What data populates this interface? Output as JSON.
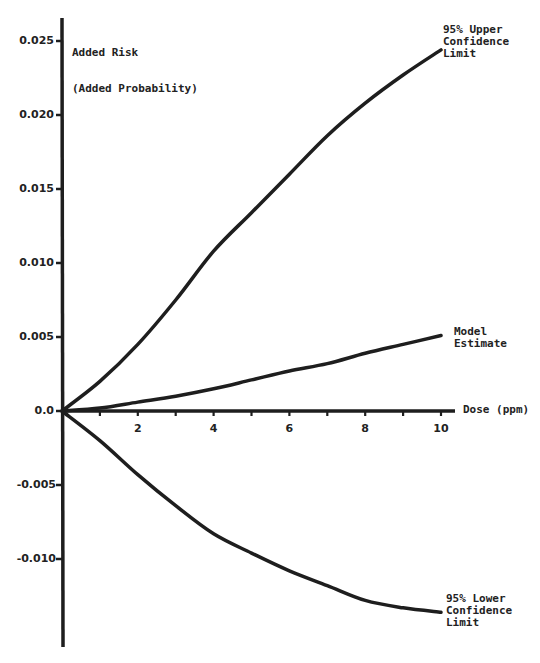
{
  "chart_data": {
    "type": "line",
    "title": "",
    "xlabel": "Dose (ppm)",
    "ylabel": "Added Risk\n(Added Probability)",
    "xlim": [
      0,
      10
    ],
    "ylim": [
      -0.016,
      0.026
    ],
    "grid": false,
    "legend": "inline labels at line ends",
    "x_ticks": [
      2,
      4,
      6,
      8,
      10
    ],
    "x_minor_ticks": [
      1,
      3,
      5,
      7,
      9
    ],
    "y_ticks": [
      {
        "value": 0.025,
        "label": "0.025"
      },
      {
        "value": 0.02,
        "label": "0.020"
      },
      {
        "value": 0.015,
        "label": "0.015"
      },
      {
        "value": 0.01,
        "label": "0.010"
      },
      {
        "value": 0.005,
        "label": "0.005"
      },
      {
        "value": 0.0,
        "label": "0.0"
      },
      {
        "value": -0.005,
        "label": "-0.005"
      },
      {
        "value": -0.01,
        "label": "-0.010"
      }
    ],
    "x": [
      0,
      1,
      2,
      3,
      4,
      5,
      6,
      7,
      8,
      9,
      10
    ],
    "series": [
      {
        "name": "95% Upper Confidence Limit",
        "label_lines": [
          "95% Upper",
          "Confidence",
          "Limit"
        ],
        "values": [
          0,
          0.002,
          0.0045,
          0.0075,
          0.0108,
          0.0134,
          0.016,
          0.0186,
          0.0208,
          0.0227,
          0.0244
        ]
      },
      {
        "name": "Model Estimate",
        "label_lines": [
          "Model",
          "Estimate"
        ],
        "values": [
          0,
          0.0002,
          0.0006,
          0.001,
          0.0015,
          0.0021,
          0.0027,
          0.0032,
          0.0039,
          0.0045,
          0.0051
        ]
      },
      {
        "name": "95% Lower Confidence Limit",
        "label_lines": [
          "95% Lower",
          "Confidence",
          "Limit"
        ],
        "values": [
          0,
          -0.002,
          -0.0043,
          -0.0064,
          -0.0083,
          -0.0096,
          -0.0108,
          -0.0118,
          -0.0128,
          -0.0133,
          -0.0136
        ]
      }
    ]
  },
  "labels": {
    "ylabel_line1": "Added Risk",
    "ylabel_line2": "(Added Probability)",
    "xlabel": "Dose (ppm)",
    "upper": "95% Upper\nConfidence\nLimit",
    "model": "Model\nEstimate",
    "lower": "95% Lower\nConfidence\nLimit"
  },
  "style": {
    "line_color": "#1e1e1e",
    "background": "#ffffff"
  }
}
